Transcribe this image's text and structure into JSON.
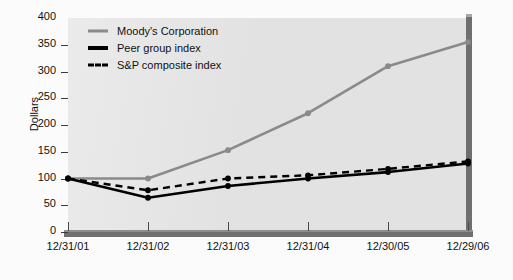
{
  "chart_data": {
    "type": "line",
    "title": "",
    "xlabel": "",
    "ylabel": "Dollars",
    "categories": [
      "12/31/01",
      "12/31/02",
      "12/31/03",
      "12/31/04",
      "12/30/05",
      "12/29/06"
    ],
    "ylim": [
      0,
      400
    ],
    "yticks": [
      0,
      50,
      100,
      150,
      200,
      250,
      300,
      350,
      400
    ],
    "grid": false,
    "legend_position": "top-left",
    "series": [
      {
        "name": "Moody's Corporation",
        "color": "#8a8a8a",
        "style": "solid",
        "values": [
          100,
          100,
          153,
          222,
          310,
          355
        ]
      },
      {
        "name": "Peer group index",
        "color": "#000000",
        "style": "solid",
        "values": [
          100,
          64,
          86,
          100,
          112,
          128
        ]
      },
      {
        "name": "S&P composite index",
        "color": "#000000",
        "style": "dashed",
        "values": [
          100,
          78,
          100,
          106,
          118,
          132
        ]
      }
    ]
  },
  "axis": {
    "y_title": "Dollars"
  },
  "legend": {
    "items": [
      {
        "label": "Moody's Corporation"
      },
      {
        "label": "Peer group index"
      },
      {
        "label": "S&P composite index"
      }
    ]
  },
  "colors": {
    "panel": "#e2e2e2",
    "wall": "#6f6f6f",
    "moodys": "#8a8a8a",
    "peer": "#000000",
    "sp": "#000000"
  }
}
